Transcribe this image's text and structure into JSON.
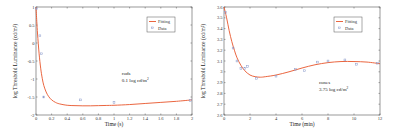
{
  "colors": {
    "fit": "#e8552a",
    "data": "#8a9acb",
    "axis": "#555555"
  },
  "chart_data": [
    {
      "type": "line",
      "id": "rods",
      "xlabel": "Time (s)",
      "ylabel": "log Threshold Luminance (cd/m²)",
      "xlim": [
        0,
        2
      ],
      "ylim": [
        -2,
        1
      ],
      "xticks": [
        0,
        0.2,
        0.4,
        0.6,
        0.8,
        1,
        1.2,
        1.4,
        1.6,
        1.8,
        2
      ],
      "xtick_labels": [
        "0",
        "0.2",
        "0.4",
        "0.6",
        "0.8",
        "1",
        "1.2",
        "1.4",
        "1.6",
        "1.8",
        "2"
      ],
      "yticks": [
        1,
        0.5,
        0,
        -0.5,
        -1,
        -1.5,
        -2
      ],
      "ytick_labels": [
        "1",
        "0.5",
        "0",
        "-0.5",
        "-1",
        "-1.5",
        "-2"
      ],
      "grid": false,
      "legend": {
        "position": "top-right",
        "entries": [
          "Fitting",
          "Data"
        ]
      },
      "annotation": {
        "line1": "rods",
        "line2": "0.1 log cd/m",
        "sup": "2",
        "x": 1.1,
        "y": -0.9
      },
      "series": [
        {
          "name": "Fitting",
          "kind": "line",
          "x": [
            0,
            0.01,
            0.02,
            0.04,
            0.06,
            0.08,
            0.1,
            0.13,
            0.16,
            0.2,
            0.25,
            0.3,
            0.4,
            0.5,
            0.6,
            0.7,
            0.8,
            0.9,
            1.0,
            1.2,
            1.4,
            1.6,
            1.8,
            2.0
          ],
          "y": [
            1.0,
            0.6,
            0.25,
            -0.3,
            -0.7,
            -0.98,
            -1.18,
            -1.36,
            -1.48,
            -1.58,
            -1.65,
            -1.69,
            -1.73,
            -1.74,
            -1.745,
            -1.745,
            -1.74,
            -1.735,
            -1.73,
            -1.71,
            -1.68,
            -1.65,
            -1.62,
            -1.58
          ]
        },
        {
          "name": "Data",
          "kind": "scatter",
          "x": [
            0.01,
            0.05,
            0.07,
            0.1,
            0.57,
            1.0,
            1.98
          ],
          "y": [
            0.95,
            0.2,
            -0.3,
            -1.5,
            -1.58,
            -1.65,
            -1.6
          ]
        }
      ]
    },
    {
      "type": "line",
      "id": "cones",
      "xlabel": "Time (min)",
      "ylabel": "log Threshold Luminance (cd/m²)",
      "xlim": [
        0,
        12
      ],
      "ylim": [
        2.6,
        3.6
      ],
      "xticks": [
        0,
        2,
        4,
        6,
        8,
        10,
        12
      ],
      "xtick_labels": [
        "0",
        "2",
        "4",
        "6",
        "8",
        "10",
        "12"
      ],
      "yticks": [
        3.6,
        3.5,
        3.4,
        3.3,
        3.2,
        3.1,
        3,
        2.9,
        2.8,
        2.7,
        2.6
      ],
      "ytick_labels": [
        "3.6",
        "3.5",
        "3.4",
        "3.3",
        "3.2",
        "3.1",
        "3",
        "2.9",
        "2.8",
        "2.7",
        "2.6"
      ],
      "grid": false,
      "legend": {
        "position": "top-right",
        "entries": [
          "Fitting",
          "Data"
        ]
      },
      "annotation": {
        "line1": "cones",
        "line2": "3.75 log cd/m",
        "sup": "2",
        "x": 7.3,
        "y": 2.89
      },
      "series": [
        {
          "name": "Fitting",
          "kind": "line",
          "x": [
            0,
            0.2,
            0.4,
            0.6,
            0.8,
            1.0,
            1.3,
            1.6,
            2.0,
            2.4,
            2.8,
            3.2,
            4.0,
            5.0,
            6.0,
            7.0,
            8.0,
            9.0,
            10.0,
            11.0,
            12.0
          ],
          "y": [
            3.6,
            3.5,
            3.38,
            3.28,
            3.2,
            3.13,
            3.06,
            3.01,
            2.97,
            2.955,
            2.95,
            2.955,
            2.97,
            3.0,
            3.035,
            3.065,
            3.085,
            3.095,
            3.095,
            3.09,
            3.075
          ]
        },
        {
          "name": "Data",
          "kind": "scatter",
          "x": [
            0.1,
            0.7,
            1.0,
            1.3,
            1.6,
            1.8,
            2.5,
            4.0,
            5.5,
            6.2,
            7.2,
            8.0,
            9.3,
            10.2,
            11.8
          ],
          "y": [
            3.55,
            3.22,
            3.1,
            3.03,
            3.03,
            3.05,
            2.94,
            2.96,
            3.02,
            3.01,
            3.09,
            3.1,
            3.11,
            3.07,
            3.08
          ]
        }
      ]
    }
  ]
}
